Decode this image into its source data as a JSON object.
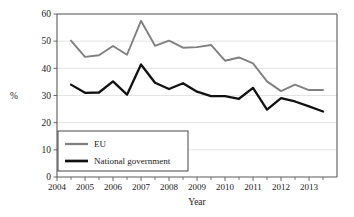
{
  "chart_data": {
    "type": "line",
    "title": "",
    "xlabel": "Year",
    "ylabel": "%",
    "xlim": [
      2004,
      2014
    ],
    "ylim": [
      0,
      60
    ],
    "ytick_labels": [
      "0",
      "10",
      "20",
      "30",
      "40",
      "50",
      "60"
    ],
    "ytick_values": [
      0,
      10,
      20,
      30,
      40,
      50,
      60
    ],
    "xtick_labels": [
      "2004",
      "2005",
      "2006",
      "2007",
      "2008",
      "2009",
      "2010",
      "2011",
      "2012",
      "2013"
    ],
    "xtick_values": [
      2004,
      2005,
      2006,
      2007,
      2008,
      2009,
      2010,
      2011,
      2012,
      2013
    ],
    "minor_xticks": [
      2004.5,
      2005.5,
      2006.5,
      2007.5,
      2008.5,
      2009.5,
      2010.5,
      2011.5,
      2012.5,
      2013.5
    ],
    "grid": "horizontal",
    "legend_position": "lower-left",
    "x": [
      2004.5,
      2005.0,
      2005.5,
      2006.0,
      2006.5,
      2007.0,
      2007.5,
      2008.0,
      2008.5,
      2009.0,
      2009.5,
      2010.0,
      2010.5,
      2011.0,
      2011.5,
      2012.0,
      2012.5,
      2013.0,
      2013.5
    ],
    "series": [
      {
        "name": "EU",
        "color": "#808080",
        "width": 1.9,
        "values": [
          50.2,
          44.2,
          44.8,
          48.2,
          45.0,
          57.5,
          48.3,
          50.2,
          47.6,
          47.8,
          48.6,
          42.8,
          44.0,
          41.8,
          35.2,
          31.6,
          34.0,
          32.0,
          32.0
        ]
      },
      {
        "name": "National government",
        "color": "#111111",
        "width": 2.3,
        "values": [
          34.0,
          31.0,
          31.1,
          35.2,
          30.3,
          41.4,
          34.7,
          32.4,
          34.5,
          31.4,
          29.8,
          29.8,
          28.8,
          32.8,
          24.8,
          29.0,
          27.8,
          26.0,
          24.1
        ]
      }
    ],
    "legend": [
      {
        "label": "EU",
        "color": "#808080"
      },
      {
        "label": "National government",
        "color": "#111111"
      }
    ]
  }
}
